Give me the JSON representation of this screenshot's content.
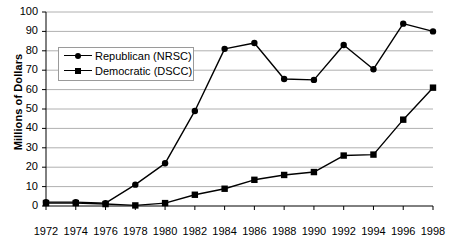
{
  "chart_data": {
    "type": "line",
    "title": "",
    "xlabel": "",
    "ylabel": "Millions of Dollars",
    "x": [
      1972,
      1974,
      1976,
      1978,
      1980,
      1982,
      1984,
      1986,
      1988,
      1990,
      1992,
      1994,
      1996,
      1998
    ],
    "categories": [
      "1972",
      "1974",
      "1976",
      "1978",
      "1980",
      "1982",
      "1984",
      "1986",
      "1988",
      "1990",
      "1992",
      "1994",
      "1996",
      "1998"
    ],
    "series": [
      {
        "name": "Republican (NRSC)",
        "marker": "circle",
        "color": "#000000",
        "values": [
          2,
          2,
          1.5,
          11,
          22,
          49,
          81,
          84,
          65.5,
          65,
          83,
          70.5,
          94,
          90
        ]
      },
      {
        "name": "Democratic (DSCC)",
        "marker": "square",
        "color": "#000000",
        "values": [
          1.5,
          1.5,
          1,
          0.3,
          1.5,
          5.8,
          8.9,
          13.5,
          16,
          17.5,
          26,
          26.5,
          44.5,
          61
        ]
      }
    ],
    "ylim": [
      0,
      100
    ],
    "yticks": [
      0,
      10,
      20,
      30,
      40,
      50,
      60,
      70,
      80,
      90,
      100
    ],
    "ytick_labels": [
      "0",
      "10",
      "20",
      "30",
      "40",
      "50",
      "60",
      "70",
      "80",
      "90",
      "100"
    ],
    "xtick_labels": [
      "1972",
      "1974",
      "1976",
      "1978",
      "1980",
      "1982",
      "1984",
      "1986",
      "1988",
      "1990",
      "1992",
      "1994",
      "1996",
      "1998"
    ],
    "grid": true,
    "grid_axis": "y",
    "legend_position": "upper left inside",
    "legend_entries": [
      "Republican (NRSC)",
      "Democratic (DSCC)"
    ],
    "plot_background": "#ffffff",
    "grid_color": "#b0b0b0",
    "axis_color": "#000000"
  },
  "axes": {
    "y_title": "Millions of Dollars"
  },
  "legend": {
    "items": [
      {
        "label": "Republican (NRSC)",
        "marker": "circle"
      },
      {
        "label": "Democratic (DSCC)",
        "marker": "square"
      }
    ]
  }
}
